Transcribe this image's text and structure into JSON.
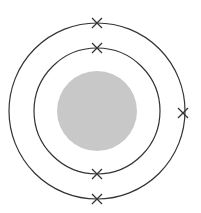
{
  "diagram": {
    "type": "atomic-shell-model",
    "center": [
      97,
      111
    ],
    "nucleus": {
      "radius": 40,
      "color": "#c8c8c8"
    },
    "shells": [
      {
        "name": "inner-shell",
        "radius": 63,
        "electrons": [
          [
            97,
            48
          ],
          [
            97,
            174
          ]
        ]
      },
      {
        "name": "outer-shell",
        "radius": 88,
        "electrons": [
          [
            97,
            23
          ],
          [
            183,
            113
          ],
          [
            97,
            199
          ]
        ]
      }
    ],
    "line_color": "#333333",
    "electron_marker": "cross",
    "electron_count": 5
  }
}
